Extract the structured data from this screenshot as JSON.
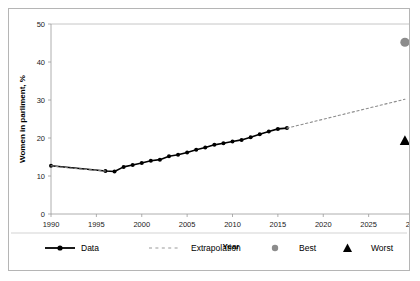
{
  "chart_data": {
    "type": "line",
    "title": "",
    "xlabel": "Year",
    "ylabel": "Women in parliment, %",
    "xlim": [
      1990,
      2030
    ],
    "ylim": [
      0,
      50
    ],
    "xticks": [
      1990,
      1995,
      2000,
      2005,
      2010,
      2015,
      2020,
      2025,
      2030
    ],
    "yticks": [
      0,
      10,
      20,
      30,
      40,
      50
    ],
    "grid": false,
    "legend_position": "bottom",
    "series": [
      {
        "name": "Data",
        "style": "solid-line-with-markers",
        "color": "#000000",
        "x": [
          1990,
          1996,
          1997,
          1998,
          1999,
          2000,
          2001,
          2002,
          2003,
          2004,
          2005,
          2006,
          2007,
          2008,
          2009,
          2010,
          2011,
          2012,
          2013,
          2014,
          2015,
          2016
        ],
        "values": [
          12.7,
          11.3,
          11.2,
          12.4,
          12.9,
          13.4,
          14.0,
          14.3,
          15.2,
          15.6,
          16.2,
          16.9,
          17.5,
          18.2,
          18.6,
          19.1,
          19.5,
          20.2,
          21.0,
          21.7,
          22.4,
          22.6
        ]
      },
      {
        "name": "Extrapolation",
        "style": "dotted-line",
        "color": "#8c8c8c",
        "x": [
          1990,
          1991,
          1992,
          1993,
          1994,
          1995,
          1996
        ],
        "values": [
          12.7,
          12.4,
          12.1,
          11.9,
          11.7,
          11.5,
          11.3
        ]
      },
      {
        "name": "Extrapolation",
        "style": "dotted-line",
        "color": "#8c8c8c",
        "x": [
          2016,
          2029
        ],
        "values": [
          22.6,
          30.2
        ]
      }
    ],
    "points": [
      {
        "name": "Best",
        "marker": "circle",
        "color": "#8c8c8c",
        "x": 2029,
        "value": 45.2
      },
      {
        "name": "Worst",
        "marker": "triangle",
        "color": "#000000",
        "x": 2029,
        "value": 19.4
      }
    ],
    "legend": [
      {
        "label": "Data",
        "marker": "line-diamond",
        "color": "#000000"
      },
      {
        "label": "Extrapolation",
        "marker": "dotted-line",
        "color": "#9a9a9a"
      },
      {
        "label": "Best",
        "marker": "circle",
        "color": "#8c8c8c"
      },
      {
        "label": "Worst",
        "marker": "triangle",
        "color": "#000000"
      }
    ]
  }
}
